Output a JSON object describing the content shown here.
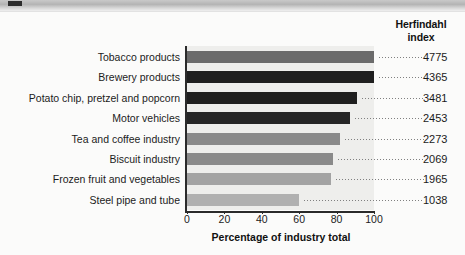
{
  "figure": {
    "background_color": "#fbfbfa",
    "plot_background_color": "#eeeeec"
  },
  "index_header": {
    "line1": "Herfindahl",
    "line2": "index"
  },
  "chart_data": {
    "type": "bar",
    "orientation": "horizontal",
    "title": "",
    "xlabel": "Percentage of industry total",
    "ylabel": "",
    "xlim": [
      0,
      105
    ],
    "xticks": [
      0,
      20,
      40,
      60,
      80,
      100
    ],
    "xtick_labels": [
      "0",
      "20",
      "40",
      "60",
      "80",
      "100"
    ],
    "grid": false,
    "legend": null,
    "categories": [
      "Tobacco products",
      "Brewery products",
      "Potato chip, pretzel and popcorn",
      "Motor vehicles",
      "Tea and coffee industry",
      "Biscuit industry",
      "Frozen fruit and vegetables",
      "Steel pipe and tube"
    ],
    "values": [
      100,
      100,
      91,
      87,
      82,
      78,
      77,
      60
    ],
    "value_series_name": "Percentage of industry total",
    "annotations": {
      "name": "Herfindahl index",
      "values": [
        4775,
        4365,
        3481,
        2453,
        2273,
        2069,
        1965,
        1038
      ]
    },
    "bar_colors": [
      "#6b6b6b",
      "#1f1f1f",
      "#1f1f1f",
      "#262626",
      "#8a8a8a",
      "#8a8a8a",
      "#a3a3a3",
      "#b0b0b0"
    ]
  },
  "rows": [
    {
      "label": "Tobacco products",
      "pct": 100,
      "index": "4775",
      "color": "#6b6b6b"
    },
    {
      "label": "Brewery products",
      "pct": 100,
      "index": "4365",
      "color": "#1f1f1f"
    },
    {
      "label": "Potato chip, pretzel and popcorn",
      "pct": 91,
      "index": "3481",
      "color": "#1f1f1f"
    },
    {
      "label": "Motor vehicles",
      "pct": 87,
      "index": "2453",
      "color": "#262626"
    },
    {
      "label": "Tea and coffee industry",
      "pct": 82,
      "index": "2273",
      "color": "#8a8a8a"
    },
    {
      "label": "Biscuit industry",
      "pct": 78,
      "index": "2069",
      "color": "#8a8a8a"
    },
    {
      "label": "Frozen fruit and vegetables",
      "pct": 77,
      "index": "1965",
      "color": "#a3a3a3"
    },
    {
      "label": "Steel pipe and tube",
      "pct": 60,
      "index": "1038",
      "color": "#b0b0b0"
    }
  ],
  "xaxis": {
    "title": "Percentage of industry total",
    "ticks": [
      "0",
      "20",
      "40",
      "60",
      "80",
      "100"
    ]
  }
}
